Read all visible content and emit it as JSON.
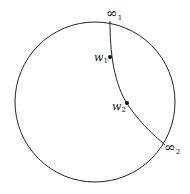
{
  "diagram": {
    "circle": {
      "cx": 95,
      "cy": 102,
      "r": 80
    },
    "geodesic": {
      "path": "M 110 21 C 110 50, 113 85, 130 108 S 158 138, 165 145"
    },
    "points": [
      {
        "id": "inf1",
        "label": "∞",
        "sub": "1",
        "x": 110,
        "y": 21,
        "lx": 106,
        "ly": 18,
        "dot": false
      },
      {
        "id": "w1",
        "label": "w",
        "sub": "1",
        "x": 110,
        "y": 57,
        "lx": 94,
        "ly": 61,
        "dot": true
      },
      {
        "id": "w2",
        "label": "w",
        "sub": "2",
        "x": 127,
        "y": 103,
        "lx": 112,
        "ly": 110,
        "dot": true
      },
      {
        "id": "inf2",
        "label": "∞",
        "sub": "2",
        "x": 165,
        "y": 145,
        "lx": 164,
        "ly": 152,
        "dot": false
      }
    ]
  }
}
